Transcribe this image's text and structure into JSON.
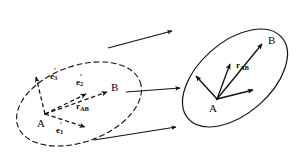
{
  "figure": {
    "stroke_color": "#121212",
    "background_color": "#ffffff"
  },
  "left_region": {
    "name": "reference-configuration",
    "outline_style": "dashed",
    "points": [
      {
        "id": "A",
        "label": "A",
        "x": 44,
        "y": 119
      },
      {
        "id": "B",
        "label": "B",
        "x": 112,
        "y": 88
      }
    ],
    "vectors": [
      {
        "id": "e3p",
        "base": "e",
        "sub": "3",
        "prime": "′",
        "style": "dashed",
        "label_x": 54,
        "label_y": 74
      },
      {
        "id": "e2p",
        "base": "e",
        "sub": "2",
        "prime": "′",
        "style": "dashed",
        "label_x": 80,
        "label_y": 80
      },
      {
        "id": "e1p",
        "base": "e",
        "sub": "1",
        "prime": "′",
        "style": "dashed",
        "label_x": 61,
        "label_y": 126
      },
      {
        "id": "rAB",
        "base": "r",
        "sub": "AB",
        "prime": "",
        "style": "dashed",
        "label_x": 80,
        "label_y": 105
      }
    ]
  },
  "right_region": {
    "name": "current-configuration",
    "outline_style": "solid",
    "points": [
      {
        "id": "A",
        "label": "A",
        "x": 214,
        "y": 106
      },
      {
        "id": "B",
        "label": "B",
        "x": 270,
        "y": 40
      }
    ],
    "vectors": [
      {
        "id": "e1",
        "style": "solid"
      },
      {
        "id": "e2",
        "style": "solid"
      },
      {
        "id": "e3",
        "style": "solid"
      },
      {
        "id": "rAB",
        "base": "r",
        "sub": "AB",
        "prime": "",
        "style": "solid",
        "label_x": 239,
        "label_y": 64
      }
    ]
  },
  "mapping_arrows": {
    "name": "configuration-mapping-arrows",
    "count": 3,
    "style": "solid",
    "direction": "right"
  },
  "labels": {
    "A": "A",
    "B": "B",
    "e_base": "e",
    "r_base": "r",
    "sub_1": "1",
    "sub_2": "2",
    "sub_3": "3",
    "sub_AB": "AB",
    "prime": "′"
  }
}
